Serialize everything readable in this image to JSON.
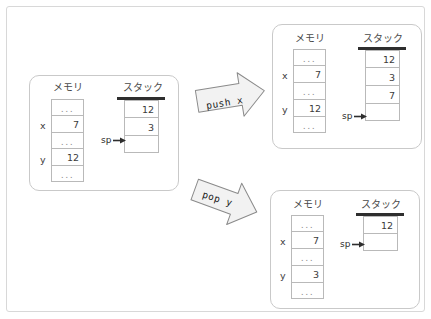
{
  "diagram": {
    "title_text": "",
    "colors": {
      "frame_border": "#d8d8d8",
      "panel_border": "#c9c9c9",
      "cell_border": "#b9b9b9",
      "stack_bar": "#2e2e2e",
      "text": "#3c3c3c",
      "dots": "#909090",
      "arrow_fill": "#f2f2f2",
      "arrow_stroke": "#8a8a8a"
    },
    "labels": {
      "memory_heading": "メモリ",
      "stack_heading": "スタック",
      "sp_label": "sp",
      "ellipsis": "..."
    },
    "panels": [
      {
        "id": "initial",
        "memory": {
          "heading": "メモリ",
          "cells": [
            {
              "name": "",
              "value": "..."
            },
            {
              "name": "x",
              "value": "7"
            },
            {
              "name": "",
              "value": "..."
            },
            {
              "name": "y",
              "value": "12"
            },
            {
              "name": "",
              "value": "..."
            }
          ]
        },
        "stack": {
          "heading": "スタック",
          "cells": [
            {
              "value": "12"
            },
            {
              "value": "3"
            },
            {
              "value": ""
            }
          ],
          "sp_label": "sp",
          "sp_points_to_index": 2
        }
      },
      {
        "id": "after-push",
        "memory": {
          "heading": "メモリ",
          "cells": [
            {
              "name": "",
              "value": "..."
            },
            {
              "name": "x",
              "value": "7"
            },
            {
              "name": "",
              "value": "..."
            },
            {
              "name": "y",
              "value": "12"
            },
            {
              "name": "",
              "value": "..."
            }
          ]
        },
        "stack": {
          "heading": "スタック",
          "cells": [
            {
              "value": "12"
            },
            {
              "value": "3"
            },
            {
              "value": "7"
            },
            {
              "value": ""
            }
          ],
          "sp_label": "sp",
          "sp_points_to_index": 3
        }
      },
      {
        "id": "after-pop",
        "memory": {
          "heading": "メモリ",
          "cells": [
            {
              "name": "",
              "value": "..."
            },
            {
              "name": "x",
              "value": "7"
            },
            {
              "name": "",
              "value": "..."
            },
            {
              "name": "y",
              "value": "3"
            },
            {
              "name": "",
              "value": "..."
            }
          ]
        },
        "stack": {
          "heading": "スタック",
          "cells": [
            {
              "value": "12"
            },
            {
              "value": ""
            }
          ],
          "sp_label": "sp",
          "sp_points_to_index": 1
        }
      }
    ],
    "transitions": [
      {
        "id": "push",
        "label": "push x",
        "direction": "up-right"
      },
      {
        "id": "pop",
        "label": "pop y",
        "direction": "down-right"
      }
    ]
  }
}
